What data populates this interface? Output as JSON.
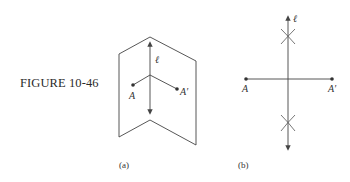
{
  "figure": {
    "title": "FIGURE 10-46",
    "panels": [
      {
        "id": "a",
        "caption": "(a)",
        "line_label": "ℓ",
        "point_labels": [
          "A",
          "A′"
        ]
      },
      {
        "id": "b",
        "caption": "(b)",
        "line_label": "ℓ",
        "point_labels": [
          "A",
          "A′"
        ]
      }
    ]
  },
  "colors": {
    "stroke": "#444444",
    "text": "#333333",
    "background": "#ffffff"
  }
}
